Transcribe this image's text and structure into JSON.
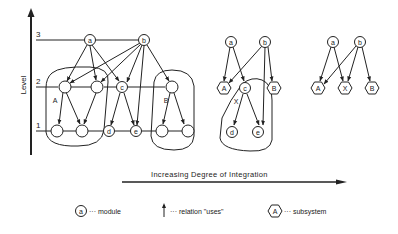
{
  "axis": {
    "y_label": "Level",
    "levels": [
      "3",
      "2",
      "1"
    ],
    "x_label": "Increasing Degree of Integration"
  },
  "graph1": {
    "nodes": {
      "a": "a",
      "b": "b",
      "c": "c",
      "d": "d",
      "e": "e"
    },
    "subsystems": {
      "A": "A",
      "B": "B"
    }
  },
  "graph2": {
    "nodes": {
      "a": "a",
      "b": "b",
      "c": "c",
      "d": "d",
      "e": "e"
    },
    "subsystems": {
      "A": "A",
      "B": "B",
      "X": "X"
    }
  },
  "graph3": {
    "nodes": {
      "a": "a",
      "b": "b"
    },
    "subsystems": {
      "A": "A",
      "X": "X",
      "B": "B"
    }
  },
  "legend": {
    "module_symbol": "a",
    "module_text": "··· module",
    "relation_text": "··· relation \"uses\"",
    "subsystem_symbol": "A",
    "subsystem_text": "··· subsystem"
  },
  "colors": {
    "ink": "#222222",
    "background": "#ffffff"
  }
}
